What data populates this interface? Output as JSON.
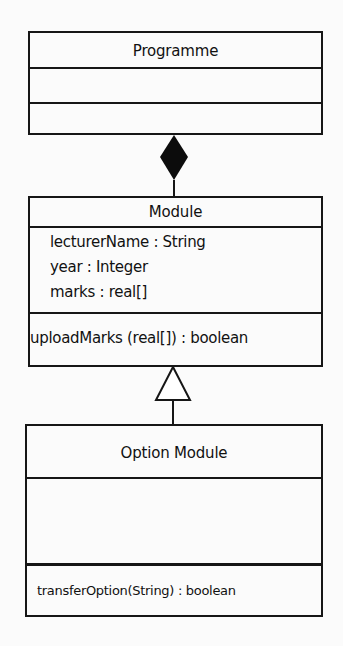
{
  "diagram": {
    "type": "UML class diagram",
    "classes": [
      {
        "name": "Programme",
        "attributes": [],
        "operations": []
      },
      {
        "name": "Module",
        "attributes": [
          "lecturerName : String",
          "year : Integer",
          "marks : real[]"
        ],
        "operations": [
          "uploadMarks (real[]) : boolean"
        ]
      },
      {
        "name": "Option Module",
        "attributes": [],
        "operations": [
          "transferOption(String) :  boolean"
        ]
      }
    ],
    "relationships": [
      {
        "type": "composition",
        "whole": "Programme",
        "part": "Module",
        "marker": "filled-diamond"
      },
      {
        "type": "generalization",
        "parent": "Module",
        "child": "Option Module",
        "marker": "hollow-triangle"
      }
    ]
  }
}
